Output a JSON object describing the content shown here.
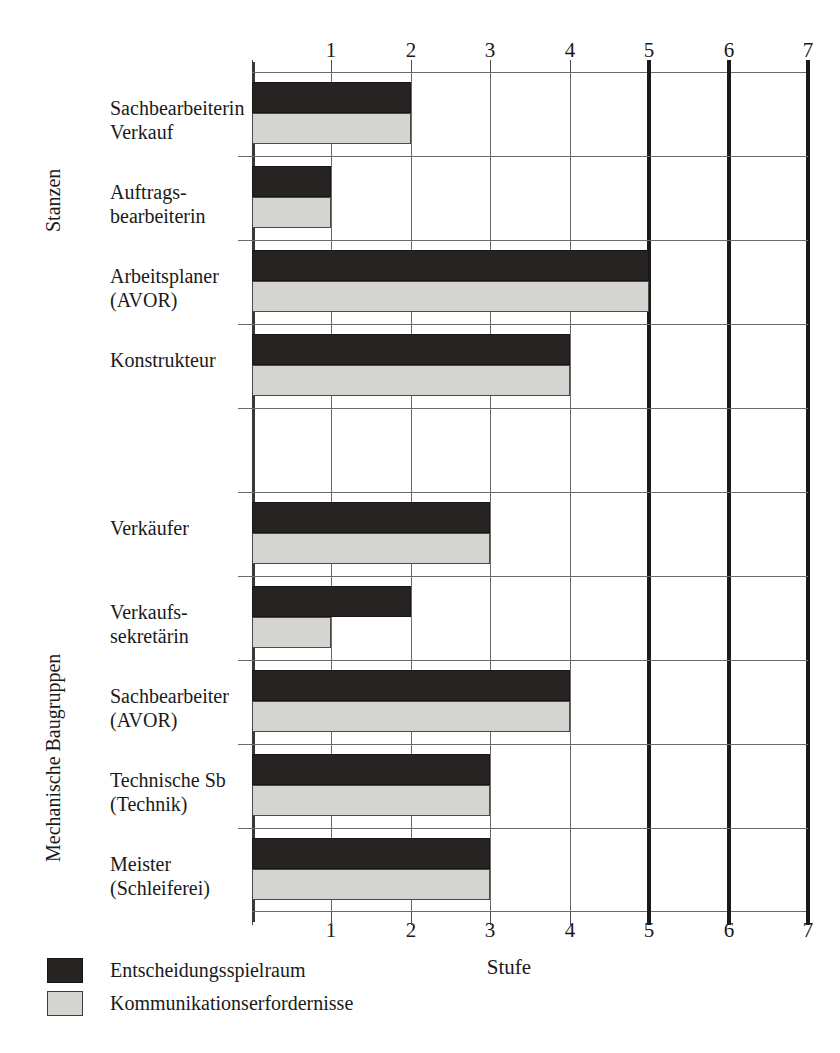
{
  "chart_data": {
    "type": "bar",
    "orientation": "horizontal",
    "title": "",
    "xlabel": "Stufe",
    "ylabel": "",
    "xlim": [
      0,
      7
    ],
    "xticks": [
      1,
      2,
      3,
      4,
      5,
      6,
      7
    ],
    "xtick_labels": [
      "1",
      "2",
      "3",
      "4",
      "5",
      "6",
      "7"
    ],
    "grid": true,
    "bold_gridlines": [
      5,
      6,
      7
    ],
    "axis_ticks_top": true,
    "axis_ticks_bottom": true,
    "legend_position": "bottom-left",
    "series": [
      {
        "name": "Entscheidungsspielraum",
        "color": "#262322",
        "values": [
          2,
          1,
          5,
          4,
          null,
          3,
          2,
          4,
          3,
          3
        ]
      },
      {
        "name": "Kommunikationserfordernisse",
        "color": "#d4d4d1",
        "values": [
          2,
          1,
          5,
          4,
          null,
          3,
          1,
          4,
          3,
          3
        ]
      }
    ],
    "categories": [
      "Sachbearbeiterin Verkauf",
      "Auftrags-bearbeiterin",
      "Arbeitsplaner (AVOR)",
      "Konstrukteur",
      "",
      "Verkäufer",
      "Verkaufs-sekretärin",
      "Sachbearbeiter (AVOR)",
      "Technische Sb (Technik)",
      "Meister (Schleiferei)"
    ],
    "groups": [
      {
        "label": "Stanzen",
        "rows": [
          0,
          1,
          2,
          3
        ]
      },
      {
        "label": "Mechanische Baugruppen",
        "rows": [
          5,
          6,
          7,
          8,
          9
        ]
      }
    ]
  },
  "rows": [
    {
      "line1": "Sachbearbeiterin",
      "line2": "Verkauf",
      "dark": 2,
      "light": 2
    },
    {
      "line1": "Auftrags-",
      "line2": "bearbeiterin",
      "dark": 1,
      "light": 1
    },
    {
      "line1": "Arbeitsplaner",
      "line2": "(AVOR)",
      "dark": 5,
      "light": 5
    },
    {
      "line1": "Konstrukteur",
      "line2": "",
      "dark": 4,
      "light": 4
    },
    {
      "line1": "",
      "line2": "",
      "dark": 0,
      "light": 0
    },
    {
      "line1": "Verkäufer",
      "line2": "",
      "dark": 3,
      "light": 3
    },
    {
      "line1": "Verkaufs-",
      "line2": "sekretärin",
      "dark": 2,
      "light": 1
    },
    {
      "line1": "Sachbearbeiter",
      "line2": "(AVOR)",
      "dark": 4,
      "light": 4
    },
    {
      "line1": "Technische Sb",
      "line2": "(Technik)",
      "dark": 3,
      "light": 3
    },
    {
      "line1": "Meister",
      "line2": "(Schleiferei)",
      "dark": 3,
      "light": 3
    }
  ],
  "groups": {
    "stanzen": "Stanzen",
    "mechanische": "Mechanische Baugruppen"
  },
  "axis": {
    "xtitle": "Stufe",
    "ticks": [
      "1",
      "2",
      "3",
      "4",
      "5",
      "6",
      "7"
    ]
  },
  "legend": {
    "dark_label": "Entscheidungsspielraum",
    "light_label": "Kommunikationserfordernisse",
    "dark_color": "#262322",
    "light_color": "#d4d4d1"
  }
}
